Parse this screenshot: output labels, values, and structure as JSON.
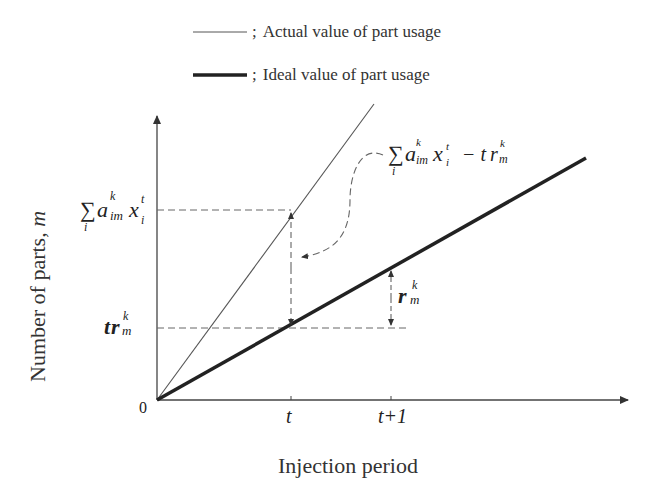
{
  "legend": {
    "items": [
      {
        "line_style": "thin",
        "separator": ";",
        "label": "Actual value of part usage"
      },
      {
        "line_style": "thick",
        "separator": ";",
        "label": "Ideal value of part usage"
      }
    ]
  },
  "axes": {
    "x_title": "Injection period",
    "y_title": "Number of parts, ",
    "y_title_var": "m",
    "origin_label": "0",
    "x_ticks": [
      "t",
      "t+1"
    ]
  },
  "annotations": {
    "y_upper": {
      "sum": "∑",
      "sum_sub": "i",
      "a": "a",
      "a_sup": "k",
      "a_sub": "im",
      "x": "x",
      "x_sup": "t",
      "x_sub": "i"
    },
    "y_lower": {
      "t": "t",
      "r": "r",
      "r_sup": "k",
      "r_sub": "m"
    },
    "difference": {
      "sum": "∑",
      "sum_sub": "i",
      "a": "a",
      "a_sup": "k",
      "a_sub": "im",
      "x": "x",
      "x_sup": "t",
      "x_sub": "i",
      "minus": "− t",
      "r": "r",
      "r_sup": "k",
      "r_sub": "m"
    },
    "rate": {
      "r": "r",
      "r_sup": "k",
      "r_sub": "m"
    }
  },
  "colors": {
    "line": "#222222",
    "thin_line": "#555555",
    "dashed": "#666666"
  }
}
